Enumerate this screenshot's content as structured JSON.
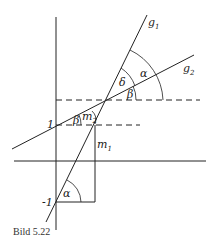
{
  "figure": {
    "caption": "Bild 5.22",
    "labels": {
      "g1": "g",
      "g1_sub": "1",
      "g2": "g",
      "g2_sub": "2",
      "alpha_top": "α",
      "delta": "δ",
      "beta_top": "β",
      "beta_left": "β",
      "m2": "m",
      "m2_sub": "2",
      "m1": "m",
      "m1_sub": "1",
      "alpha_bottom": "α",
      "tick_one": "1",
      "tick_minus_one": "-1"
    },
    "colors": {
      "line": "#222222",
      "background": "#ffffff"
    }
  }
}
